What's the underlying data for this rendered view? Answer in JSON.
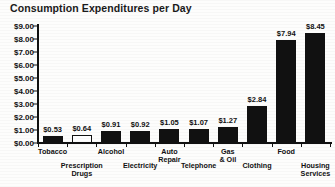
{
  "chart_data": {
    "type": "bar",
    "title": "Consumption Expenditures per Day",
    "xlabel": "",
    "ylabel": "",
    "ylim": [
      0,
      9
    ],
    "ytick_step": 1,
    "grid": false,
    "legend": "none",
    "y_tick_labels": [
      "$9.00",
      "$8.00",
      "$7.00",
      "$6.00",
      "$5.00",
      "$4.00",
      "$3.00",
      "$2.00",
      "$1.00",
      "$0.00"
    ],
    "y_tick_values": [
      9,
      8,
      7,
      6,
      5,
      4,
      3,
      2,
      1,
      0
    ],
    "categories": [
      "Tobacco",
      "Prescription\nDrugs",
      "Alcohol",
      "Electricity",
      "Auto\nRepair",
      "Telephone",
      "Gas\n& Oil",
      "Clothing",
      "Food",
      "Housing\nServices"
    ],
    "values": [
      0.53,
      0.64,
      0.91,
      0.92,
      1.05,
      1.07,
      1.27,
      2.84,
      7.94,
      8.45
    ],
    "value_labels": [
      "$0.53",
      "$0.64",
      "$0.91",
      "$0.92",
      "$1.05",
      "$1.07",
      "$1.27",
      "$2.84",
      "$7.94",
      "$8.45"
    ],
    "bar_styles": [
      "solid",
      "hollow",
      "solid",
      "solid",
      "solid",
      "solid",
      "solid",
      "solid",
      "solid",
      "solid"
    ],
    "label_rows": [
      "top",
      "bottom",
      "top",
      "bottom",
      "top",
      "bottom",
      "top",
      "bottom",
      "top",
      "bottom"
    ],
    "colors": {
      "bar_fill": "#111111",
      "bar_hollow_fill": "#ffffff",
      "bar_outline": "#111111",
      "axis": "#111111",
      "text": "#111111",
      "background": "#fdfdfc"
    }
  }
}
